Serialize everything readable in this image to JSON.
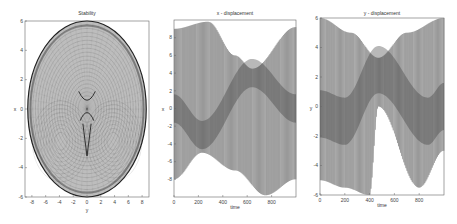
{
  "chart_data": [
    {
      "type": "scatter",
      "title": "Stability",
      "xlabel": "y",
      "ylabel": "x",
      "xlim": [
        -9,
        9
      ],
      "ylim": [
        -6,
        6
      ],
      "xticks": [
        "-8",
        "-6",
        "-4",
        "-2",
        "0",
        "2",
        "4",
        "6",
        "8"
      ],
      "yticks": [
        "6",
        "4",
        "2",
        "0",
        "-2",
        "-4",
        "-6"
      ],
      "grid": false,
      "description": "Dense dotted mesh forming an oval outline (x range approx -8.5..8.5, y range approx -6..6) with two lobes and a pinched center near origin"
    },
    {
      "type": "line",
      "title": "x - displacement",
      "xlabel": "time",
      "ylabel": "x",
      "xlim": [
        0,
        1000
      ],
      "ylim": [
        -10,
        10
      ],
      "xticks": [
        "0",
        "200",
        "400",
        "600",
        "800"
      ],
      "yticks": [
        "8",
        "6",
        "4",
        "2",
        "0",
        "-2",
        "-4",
        "-6",
        "-8"
      ],
      "grid": false,
      "description": "Rapid oscillation with slowly varying envelope; upper envelope peaks ~9.5 near t=280, lower envelope ~-9.5 near t=750; mean drifts from ~0 at t=0 to ~-3 near t=230 up to ~4 near t=640 back to ~0 at t=1000",
      "envelope_upper": [
        [
          0,
          9
        ],
        [
          280,
          9.8
        ],
        [
          500,
          6
        ],
        [
          640,
          4.5
        ],
        [
          1000,
          9.2
        ]
      ],
      "envelope_lower": [
        [
          0,
          -8
        ],
        [
          230,
          -5
        ],
        [
          500,
          -7
        ],
        [
          750,
          -9.8
        ],
        [
          1000,
          -8
        ]
      ]
    },
    {
      "type": "line",
      "title": "y - displacement",
      "xlabel": "time",
      "ylabel": "y",
      "xlim": [
        0,
        1000
      ],
      "ylim": [
        -6,
        6
      ],
      "xticks": [
        "0",
        "200",
        "400",
        "600",
        "800"
      ],
      "yticks": [
        "6",
        "4",
        "2",
        "0",
        "-2",
        "-4",
        "-6"
      ],
      "grid": false,
      "description": "Rapid oscillation with slowly varying envelope; symmetric hourglass shape; mean rises from ~-0.5 at t=0 to ~2.5 near t=470 and returns to ~-1 near t=870",
      "envelope_upper": [
        [
          0,
          6
        ],
        [
          250,
          5
        ],
        [
          470,
          3.3
        ],
        [
          700,
          5
        ],
        [
          1000,
          6
        ]
      ],
      "envelope_lower": [
        [
          0,
          -5
        ],
        [
          200,
          -5.5
        ],
        [
          400,
          -6
        ],
        [
          470,
          0
        ],
        [
          800,
          -5.5
        ],
        [
          1000,
          -3
        ]
      ]
    }
  ],
  "panels": {
    "left": {
      "title": "Stability",
      "xlabel": "y",
      "ylabel": "x",
      "xticks": [
        "-8",
        "-6",
        "-4",
        "-2",
        "0",
        "2",
        "4",
        "6",
        "8"
      ],
      "yticks": [
        "6",
        "4",
        "2",
        "0",
        "-2",
        "-4",
        "-6"
      ]
    },
    "middle": {
      "title": "x - displacement",
      "xlabel": "time",
      "ylabel": "x",
      "xticks": [
        "0",
        "200",
        "400",
        "600",
        "800"
      ],
      "yticks": [
        "8",
        "6",
        "4",
        "2",
        "0",
        "-2",
        "-4",
        "-6",
        "-8"
      ]
    },
    "right": {
      "title": "y - displacement",
      "xlabel": "time",
      "ylabel": "y",
      "xticks": [
        "0",
        "200",
        "400",
        "600",
        "800"
      ],
      "yticks": [
        "6",
        "4",
        "2",
        "0",
        "-2",
        "-4",
        "-6"
      ]
    }
  },
  "colors": {
    "ink": "#222222",
    "axis": "#555555",
    "background": "#ffffff"
  }
}
